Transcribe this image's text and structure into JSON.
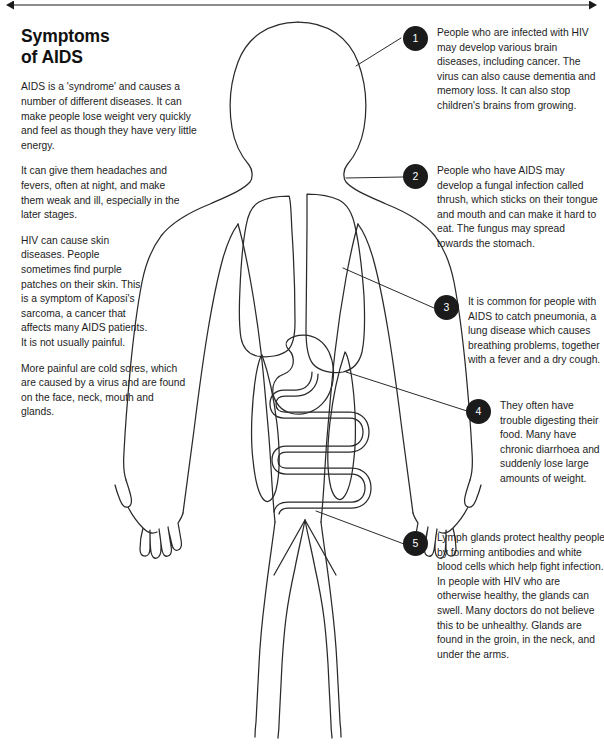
{
  "page": {
    "width": 604,
    "height": 751,
    "background": "#ffffff",
    "ink": "#1a1a1a",
    "marker_fill": "#1b1b1b",
    "marker_text": "#ffffff"
  },
  "title": "Symptoms\nof AIDS",
  "intro_paragraphs": [
    "AIDS is a 'syndrome' and causes a number of different diseases. It can make people lose weight very quickly and feel as though they have very little energy.",
    "It can give them headaches and fevers, often at night, and make them weak and ill, especially in the later stages.",
    "HIV can cause skin diseases. People sometimes find purple patches on their skin. This is a symptom of Kaposi's sarcoma, a cancer that affects many AIDS patients. It is not usually painful.",
    "More painful are cold sores, which are caused by a virus and are found on the face, neck, mouth and glands."
  ],
  "callouts": [
    {
      "number": "1",
      "text": "People who are infected with HIV may develop various brain diseases, including cancer. The virus can also cause dementia and memory loss. It can also stop children's brains from growing.",
      "target": "brain"
    },
    {
      "number": "2",
      "text": "People who have AIDS may develop a fungal infection called thrush, which sticks on their tongue and mouth and can make it hard to eat. The fungus may spread towards the stomach.",
      "target": "mouth-throat"
    },
    {
      "number": "3",
      "text": "It is common for people with AIDS to catch pneumonia, a lung disease which causes breathing problems, together with a fever and a dry cough.",
      "target": "lungs"
    },
    {
      "number": "4",
      "text": "They often have trouble digesting their food. Many have chronic diarrhoea and suddenly lose large amounts of weight.",
      "target": "stomach-intestines"
    },
    {
      "number": "5",
      "text": "Lymph glands protect healthy people by forming antibodies and white blood cells which help fight infection. In people with HIV who are otherwise healthy, the glands can swell. Many doctors do not believe this to be unhealthy. Glands are found in the groin, in the neck, and under the arms.",
      "target": "groin-lymph-glands"
    }
  ],
  "figure": {
    "label": "human-body-outline",
    "organs": [
      "left-lung",
      "right-lung",
      "stomach",
      "intestines",
      "left-hip-gland",
      "right-hip-gland"
    ]
  }
}
